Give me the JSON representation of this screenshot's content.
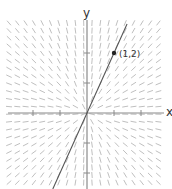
{
  "diagram": {
    "type": "slope_field",
    "equation": "dy/dx = y/x",
    "axes": {
      "x_label": "x",
      "y_label": "y",
      "origin_px": [
        87,
        113
      ],
      "unit_px": [
        27,
        30
      ],
      "x_ticks": [
        -2,
        -1,
        1,
        2
      ],
      "y_ticks": [
        -2,
        -1,
        1,
        2
      ],
      "axis_color": "#8a8a8a"
    },
    "field": {
      "x_range_px": [
        9,
        163
      ],
      "y_range_px": [
        23,
        189
      ],
      "spacing_px": [
        8.3,
        7.6
      ],
      "segment_length_px": 5.2,
      "segment_color": "#b8b8b8"
    },
    "solution_curve": {
      "label": "y = 2x",
      "slope": 2,
      "color": "#555555"
    },
    "point": {
      "label": "(1,2)",
      "x": 1,
      "y": 2,
      "color": "#222222"
    },
    "caption_cut_off": "~ ~ ~ ~ ~ ~"
  }
}
